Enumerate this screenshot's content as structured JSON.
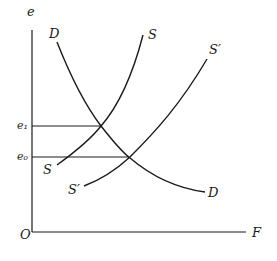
{
  "diagram": {
    "type": "supply-demand",
    "axes": {
      "y_label": "e",
      "x_label": "F",
      "origin_label": "O"
    },
    "levels": [
      {
        "id": "e1",
        "label": "e₁"
      },
      {
        "id": "e0",
        "label": "e₀"
      }
    ],
    "curves": [
      {
        "id": "D",
        "label_top": "D",
        "label_bottom": "D"
      },
      {
        "id": "S",
        "label_top": "S",
        "label_bottom": "S"
      },
      {
        "id": "S_prime",
        "label_top": "S′",
        "label_bottom": "S′"
      }
    ],
    "colors": {
      "line": "#1a1a1a",
      "background": "#ffffff"
    }
  }
}
